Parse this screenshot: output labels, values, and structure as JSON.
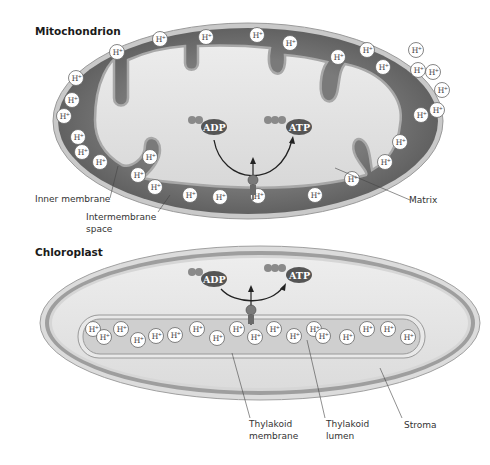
{
  "mitochondrion": {
    "title": "Mitochondrion",
    "labels": {
      "inner_membrane": "Inner membrane",
      "intermembrane_space_line1": "Intermembrane",
      "intermembrane_space_line2": "space",
      "matrix": "Matrix"
    },
    "molecules": {
      "adp": "ADP",
      "atp": "ATP"
    },
    "proton_label": "H+",
    "proton_count": 30
  },
  "chloroplast": {
    "title": "Chloroplast",
    "labels": {
      "thylakoid_membrane_line1": "Thylakoid",
      "thylakoid_membrane_line2": "membrane",
      "thylakoid_lumen_line1": "Thylakoid",
      "thylakoid_lumen_line2": "lumen",
      "stroma": "Stroma"
    },
    "molecules": {
      "adp": "ADP",
      "atp": "ATP"
    },
    "proton_label": "H+",
    "proton_count": 18
  },
  "colors": {
    "intermembrane": "#6e6e6e",
    "matrix": "#e2e2e2",
    "membrane": "#b8b8b8",
    "molecule": "#555555",
    "phosphate": "#8a8a8a",
    "stroma": "#e6e6e6",
    "thylakoid_lumen": "#cfcfcf"
  }
}
